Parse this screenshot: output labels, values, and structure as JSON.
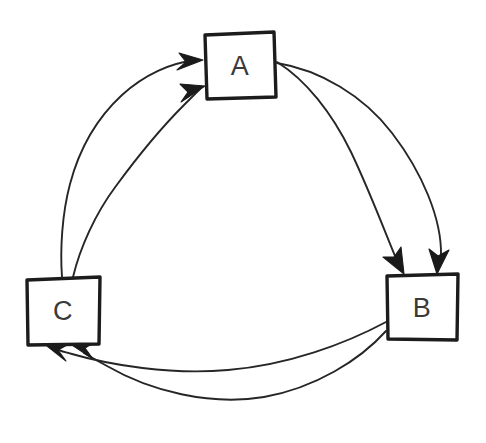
{
  "diagram": {
    "style": "hand-drawn sketch",
    "background_color": "#ffffff",
    "stroke_color": "#262626",
    "box_stroke_color": "#1c1c1c",
    "label_color": "#3a3a3a",
    "nodes": [
      {
        "id": "A",
        "label": "A",
        "x": 204,
        "y": 33,
        "width": 72,
        "height": 66,
        "center_x": 240,
        "center_y": 66
      },
      {
        "id": "B",
        "label": "B",
        "x": 386,
        "y": 274,
        "width": 73,
        "height": 67,
        "center_x": 422,
        "center_y": 308
      },
      {
        "id": "C",
        "label": "C",
        "x": 26,
        "y": 277,
        "width": 75,
        "height": 68,
        "center_x": 63,
        "center_y": 311
      }
    ],
    "edges": [
      {
        "id": "a-to-b-outer",
        "from": "A",
        "to": "B",
        "arrowhead_at": "B"
      },
      {
        "id": "a-to-b-inner",
        "from": "A",
        "to": "B",
        "arrowhead_at": "B"
      },
      {
        "id": "b-to-c-outer",
        "from": "B",
        "to": "C",
        "arrowhead_at": "C"
      },
      {
        "id": "b-to-c-inner",
        "from": "B",
        "to": "C",
        "arrowhead_at": "C"
      },
      {
        "id": "c-to-a-outer",
        "from": "C",
        "to": "A",
        "arrowhead_at": "A"
      },
      {
        "id": "c-to-a-inner",
        "from": "C",
        "to": "A",
        "arrowhead_at": "A"
      }
    ],
    "edge_count": 6,
    "node_count": 3
  }
}
